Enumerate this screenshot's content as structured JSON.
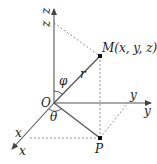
{
  "diagram": {
    "type": "spherical-coordinates",
    "labels": {
      "z_axis_1": "z",
      "z_axis_2": "z",
      "y_axis_1": "y",
      "y_axis_2": "y",
      "x_axis_1": "x",
      "x_axis_2": "x",
      "origin": "O",
      "point_m": "M(x, y, z)",
      "point_p": "P",
      "radius": "r",
      "polar_angle": "φ",
      "azimuth_angle": "θ"
    },
    "colors": {
      "axis": "#555555",
      "dashed": "#888888",
      "text": "#222222"
    }
  }
}
